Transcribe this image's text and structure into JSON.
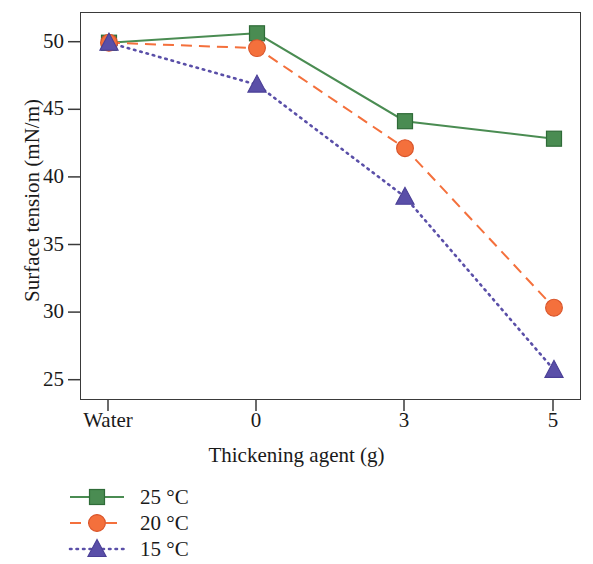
{
  "chart_data": {
    "type": "line",
    "title": "",
    "xlabel": "Thickening agent (g)",
    "ylabel": "Surface tension (mN/m)",
    "categories": [
      "Water",
      "0",
      "3",
      "5"
    ],
    "xtick_labels": [
      "Water",
      "0",
      "3",
      "5"
    ],
    "ytick_labels": [
      "25",
      "30",
      "35",
      "40",
      "45",
      "50"
    ],
    "yticks": [
      25,
      30,
      35,
      40,
      45,
      50
    ],
    "ylim": [
      23.5,
      52.2
    ],
    "grid": false,
    "legend_position": "below-axis-left",
    "series": [
      {
        "name": "25 °C",
        "values": [
          50.0,
          50.7,
          44.2,
          42.9
        ],
        "color": "#4a8c52",
        "marker": "square",
        "linestyle": "solid"
      },
      {
        "name": "20 °C",
        "values": [
          50.0,
          49.6,
          42.2,
          30.4
        ],
        "color": "#f4703c",
        "marker": "circle",
        "linestyle": "dashed"
      },
      {
        "name": "15 °C",
        "values": [
          50.0,
          46.9,
          38.6,
          25.8
        ],
        "color": "#5a4fa8",
        "marker": "triangle",
        "linestyle": "dotted"
      }
    ]
  },
  "axes": {
    "y_title": "Surface tension (mN/m)",
    "x_title": "Thickening agent (g)",
    "y_ticks": [
      "50",
      "45",
      "40",
      "35",
      "30",
      "25"
    ],
    "x_ticks": [
      "Water",
      "0",
      "3",
      "5"
    ]
  },
  "legend": {
    "entries": [
      {
        "label": "25 °C",
        "color": "#4a8c52",
        "marker": "square",
        "linestyle": "solid"
      },
      {
        "label": "20 °C",
        "color": "#f4703c",
        "marker": "circle",
        "linestyle": "dashed"
      },
      {
        "label": "15 °C",
        "color": "#5a4fa8",
        "marker": "triangle",
        "linestyle": "dotted"
      }
    ]
  }
}
